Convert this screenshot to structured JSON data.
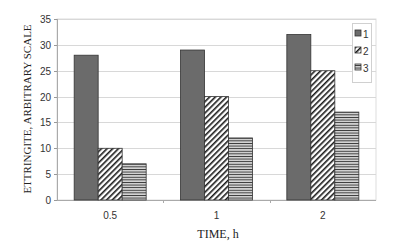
{
  "chart_data": {
    "type": "bar",
    "title": "",
    "xlabel": "TIME, h",
    "ylabel": "ETTRINGITE, ARBITRARY SCALE",
    "categories": [
      "0.5",
      "1",
      "2"
    ],
    "series": [
      {
        "name": "1",
        "values": [
          28,
          29,
          32
        ],
        "fill": "solid",
        "color": "#6b6b6b"
      },
      {
        "name": "2",
        "values": [
          10,
          20,
          25
        ],
        "fill": "diagonal-hatch",
        "color": "#222222"
      },
      {
        "name": "3",
        "values": [
          7,
          12,
          17
        ],
        "fill": "horizontal-lines",
        "color": "#333333"
      }
    ],
    "ylim": [
      0,
      35
    ],
    "yticks": [
      0,
      5,
      10,
      15,
      20,
      25,
      30,
      35
    ],
    "grid": true,
    "legend_position": "top-right-inside"
  }
}
